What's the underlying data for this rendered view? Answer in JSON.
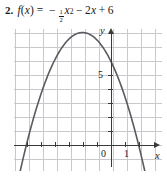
{
  "problem": {
    "number": "2.",
    "function_name": "f",
    "paren_open": "(",
    "argument": "x",
    "paren_close": ")",
    "equals": "=",
    "minus_1": "−",
    "frac_numerator": "1",
    "frac_denominator": "2",
    "x_squared_var": "x",
    "x_squared_exp": "2",
    "minus_2": "−",
    "coef_2": "2",
    "linear_var": "x",
    "plus": "+",
    "constant": "6",
    "equation_plain": "f(x) = -1/2 x^2 - 2x + 6"
  },
  "graph": {
    "x_axis_label": "x",
    "y_axis_label": "y",
    "origin_label": "0",
    "x_tick_label_1": "1",
    "y_tick_label_5": "5"
  },
  "colors": {
    "grid": "#c9c9cd",
    "axis": "#3a3a3a",
    "curve": "#5a5a60",
    "text": "#1a1a1a",
    "background": "#ffffff"
  },
  "chart_data": {
    "type": "line",
    "title": "",
    "xlabel": "x",
    "ylabel": "y",
    "equation": "f(x) = -1/2x^2 - 2x + 6",
    "grid": true,
    "legend": "none",
    "xlim": [
      -7,
      3.5
    ],
    "ylim": [
      -3,
      9.5
    ],
    "x_ticks": [
      0,
      1
    ],
    "y_ticks": [
      5
    ],
    "grid_spacing": 1,
    "vertex": [
      -2,
      8
    ],
    "y_intercept": 6,
    "x_intercepts": [
      -6,
      2
    ],
    "axis_of_symmetry": -2,
    "opens": "down",
    "series": [
      {
        "name": "f(x) = -1/2x^2 - 2x + 6",
        "x": [
          -7,
          -6.5,
          -6,
          -5.5,
          -5,
          -4.5,
          -4,
          -3.5,
          -3,
          -2.5,
          -2,
          -1.5,
          -1,
          -0.5,
          0,
          0.5,
          1,
          1.5,
          2,
          2.5,
          3
        ],
        "y": [
          -4.5,
          -2.125,
          0,
          1.875,
          3.5,
          4.875,
          6,
          6.875,
          7.5,
          7.875,
          8,
          7.875,
          7.5,
          6.875,
          6,
          4.875,
          3.5,
          1.875,
          0,
          -2.125,
          -4.5
        ]
      }
    ]
  }
}
